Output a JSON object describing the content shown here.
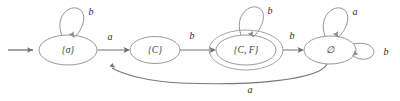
{
  "figure": {
    "type": "state-transition-diagram",
    "width": 400,
    "height": 101,
    "background_color": "#ffffff",
    "stroke_color": "#8d8d95",
    "text_color": "#2e2e33"
  },
  "states": [
    {
      "id": "sigma",
      "label": "{σ}",
      "cx": 68,
      "cy": 50,
      "rx": 29,
      "ry": 15,
      "accepting": false,
      "start": true
    },
    {
      "id": "C",
      "label": "{C}",
      "cx": 155,
      "cy": 50,
      "rx": 25,
      "ry": 13.5,
      "accepting": false,
      "start": false
    },
    {
      "id": "CF",
      "label": "{C, F}",
      "cx": 246,
      "cy": 50,
      "rx": 30,
      "ry": 15,
      "accepting": true,
      "start": false
    },
    {
      "id": "empty",
      "label": "∅",
      "cx": 330,
      "cy": 50,
      "rx": 26,
      "ry": 14,
      "accepting": false,
      "start": false
    }
  ],
  "transitions": [
    {
      "id": "t-start",
      "from": "",
      "to": "sigma",
      "label": "",
      "kind": "start-marker"
    },
    {
      "id": "t-sigma-loop",
      "from": "sigma",
      "to": "sigma",
      "label": "b",
      "kind": "self-loop-top",
      "label_x": 91,
      "label_y": 13
    },
    {
      "id": "t-sigma-C",
      "from": "sigma",
      "to": "C",
      "label": "a",
      "kind": "straight",
      "label_x": 110,
      "label_y": 38
    },
    {
      "id": "t-C-CF",
      "from": "C",
      "to": "CF",
      "label": "b",
      "kind": "straight",
      "label_x": 192,
      "label_y": 37
    },
    {
      "id": "t-CF-loop",
      "from": "CF",
      "to": "CF",
      "label": "b",
      "kind": "self-loop-top",
      "label_x": 270,
      "label_y": 12
    },
    {
      "id": "t-CF-empty",
      "from": "CF",
      "to": "empty",
      "label": "b",
      "kind": "straight",
      "label_x": 292,
      "label_y": 37
    },
    {
      "id": "t-empty-loopa",
      "from": "empty",
      "to": "empty",
      "label": "a",
      "kind": "self-loop-top",
      "label_x": 355,
      "label_y": 13
    },
    {
      "id": "t-empty-loopb",
      "from": "empty",
      "to": "empty",
      "label": "b",
      "kind": "self-loop-right",
      "label_x": 386,
      "label_y": 53
    },
    {
      "id": "t-empty-C",
      "from": "empty",
      "to": "C",
      "label": "a",
      "kind": "curve-bottom",
      "label_x": 250,
      "label_y": 91
    }
  ],
  "alphabet": [
    "a",
    "b"
  ]
}
